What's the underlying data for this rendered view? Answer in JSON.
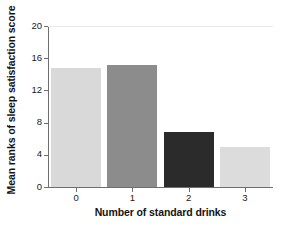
{
  "chart_data": {
    "type": "bar",
    "title": "",
    "subtitle": "",
    "xlabel": "Number of standard drinks",
    "ylabel": "Mean ranks of sleep satisfaction score",
    "categories": [
      "0",
      "1",
      "2",
      "3"
    ],
    "values": [
      14.8,
      15.2,
      6.8,
      5.0
    ],
    "series": [
      {
        "name": "Mean ranks of sleep satisfaction score",
        "values": [
          14.8,
          15.2,
          6.8,
          5.0
        ]
      }
    ],
    "bar_colors": [
      "#d9d9d9",
      "#8c8c8c",
      "#2b2b2b",
      "#dcdcdc"
    ],
    "xlim": [
      -0.5,
      3.5
    ],
    "ylim": [
      0,
      20
    ],
    "yticks": [
      0,
      4,
      8,
      12,
      16,
      20
    ],
    "ytick_labels": [
      "0",
      "4",
      "8",
      "12",
      "16",
      "20"
    ],
    "xticks": [
      0,
      1,
      2,
      3
    ],
    "xtick_labels": [
      "0",
      "1",
      "2",
      "3"
    ],
    "grid": "faint horizontal gridline at y=20 only",
    "legend": "none",
    "legend_position": "none",
    "annotations": []
  },
  "style": {
    "background": "#ffffff",
    "axis_color": "#6e6e6e",
    "text_color": "#141414",
    "gridline_color": "#e8e8e8"
  }
}
